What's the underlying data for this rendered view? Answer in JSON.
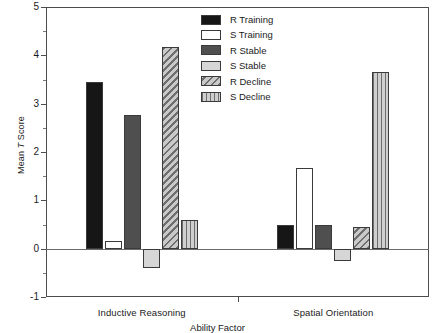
{
  "chart_data": {
    "type": "bar",
    "title": "",
    "xlabel": "Ability Factor",
    "ylabel_prefix": "Mean ",
    "ylabel_italic": "T",
    "ylabel_suffix": " Score",
    "categories": [
      "Inductive Reasoning",
      "Spatial Orientation"
    ],
    "ylim": [
      -1,
      5
    ],
    "ytick_labels": [
      "5",
      "4",
      "3",
      "2",
      "1",
      "0",
      "-1"
    ],
    "ytick_values": [
      5,
      4,
      3,
      2,
      1,
      0,
      -1
    ],
    "yminor_step": 0.5,
    "grid": false,
    "legend_position": "top-right",
    "series": [
      {
        "name": "R Training",
        "pattern": "solid-black",
        "values": [
          3.45,
          0.5
        ]
      },
      {
        "name": "S Training",
        "pattern": "solid-white",
        "values": [
          0.15,
          1.67
        ]
      },
      {
        "name": "R Stable",
        "pattern": "solid-dark-gray",
        "values": [
          2.77,
          0.5
        ]
      },
      {
        "name": "S Stable",
        "pattern": "solid-light-gray",
        "values": [
          -0.4,
          -0.25
        ]
      },
      {
        "name": "R Decline",
        "pattern": "diagonal-hatch",
        "values": [
          4.17,
          0.45
        ]
      },
      {
        "name": "S Decline",
        "pattern": "vertical-stripes",
        "values": [
          0.6,
          3.65
        ]
      }
    ]
  },
  "colors": {
    "r_training": "#161616",
    "s_training": "#ffffff",
    "r_stable": "#4f4f4f",
    "s_stable": "#d6d6d6",
    "r_decline": "#a8a8a8",
    "s_decline": "#b5b5b5",
    "axis": "#4d4d4d"
  }
}
